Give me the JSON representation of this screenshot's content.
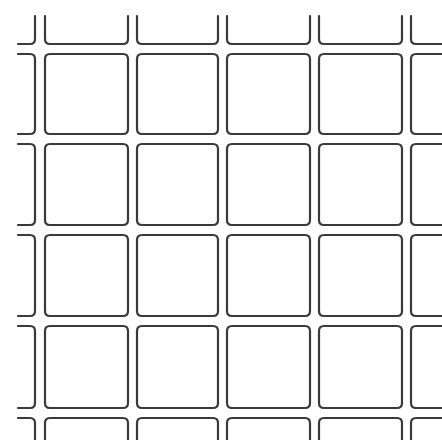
{
  "image": {
    "description": "Grid of rounded square outlines",
    "width": 442,
    "height": 440,
    "background": "#ffffff",
    "stroke_color": "#3a3a3a",
    "stroke_width": 2.2,
    "corner_radius": 5
  },
  "grid": {
    "columns": [
      {
        "x0": -40,
        "x1": 35,
        "open_left": true
      },
      {
        "x0": 45,
        "x1": 128
      },
      {
        "x0": 137,
        "x1": 218
      },
      {
        "x0": 227,
        "x1": 310
      },
      {
        "x0": 319,
        "x1": 402
      },
      {
        "x0": 411,
        "x1": 520,
        "open_right": true
      }
    ],
    "rows": [
      {
        "y0": 16,
        "y1": 44,
        "open_top": true
      },
      {
        "y0": 54,
        "y1": 134
      },
      {
        "y0": 144,
        "y1": 225
      },
      {
        "y0": 235,
        "y1": 316
      },
      {
        "y0": 326,
        "y1": 408
      },
      {
        "y0": 418,
        "y1": 520,
        "open_bottom": true
      }
    ]
  }
}
